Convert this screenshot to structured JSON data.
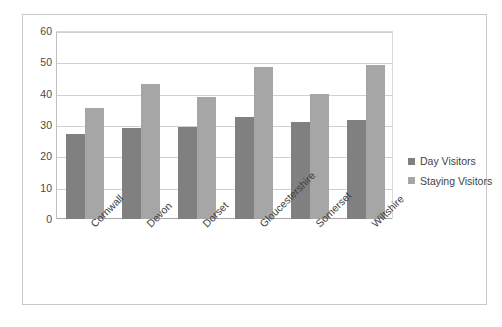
{
  "chart_data": {
    "type": "bar",
    "title": "",
    "xlabel": "",
    "ylabel": "",
    "categories": [
      "Cornwall",
      "Devon",
      "Dorset",
      "Gloucestershire",
      "Somerset",
      "Wiltshire"
    ],
    "series": [
      {
        "name": "Day Visitors",
        "color": "#808080",
        "values": [
          27,
          29,
          29.5,
          32.5,
          31,
          31.5
        ]
      },
      {
        "name": "Staying Visitors",
        "color": "#a6a6a6",
        "values": [
          35.5,
          43,
          39,
          48.5,
          40,
          49
        ]
      }
    ],
    "ylim": [
      0,
      60
    ],
    "ytick_values": [
      0,
      10,
      20,
      30,
      40,
      50,
      60
    ],
    "ytick_labels": [
      "0",
      "10",
      "20",
      "30",
      "40",
      "50",
      "60"
    ],
    "grid": true,
    "grid_axis": "y",
    "legend_position": "right",
    "border_color": "#c8c8c8",
    "gridline_color": "#d0d0d0"
  },
  "legend": {
    "items": [
      {
        "label": "Day Visitors",
        "color": "#808080"
      },
      {
        "label": "Staying Visitors",
        "color": "#a6a6a6"
      }
    ]
  }
}
